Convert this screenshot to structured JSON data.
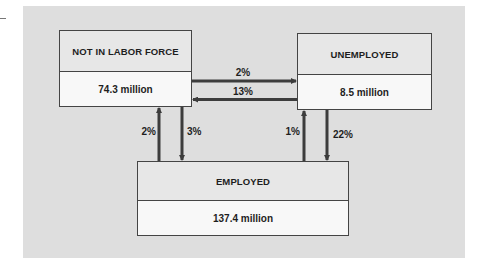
{
  "diagram": {
    "type": "labor-market-flows",
    "nodes": [
      {
        "id": "nlf",
        "title": "NOT IN LABOR FORCE",
        "value": "74.3 million"
      },
      {
        "id": "unemployed",
        "title": "UNEMPLOYED",
        "value": "8.5 million"
      },
      {
        "id": "employed",
        "title": "EMPLOYED",
        "value": "137.4 million"
      }
    ],
    "flows": {
      "nlf_to_unemployed": {
        "from": "NOT IN LABOR FORCE",
        "to": "UNEMPLOYED",
        "label": "2%"
      },
      "unemployed_to_nlf": {
        "from": "UNEMPLOYED",
        "to": "NOT IN LABOR FORCE",
        "label": "13%"
      },
      "employed_to_nlf": {
        "from": "EMPLOYED",
        "to": "NOT IN LABOR FORCE",
        "label": "2%"
      },
      "nlf_to_employed": {
        "from": "NOT IN LABOR FORCE",
        "to": "EMPLOYED",
        "label": "3%"
      },
      "employed_to_unemployed": {
        "from": "EMPLOYED",
        "to": "UNEMPLOYED",
        "label": "1%"
      },
      "unemployed_to_employed": {
        "from": "UNEMPLOYED",
        "to": "EMPLOYED",
        "label": "22%"
      }
    }
  },
  "colors": {
    "panel": "#dedede",
    "box_header": "#e7e7e7",
    "box_body": "#f8f8f8",
    "border": "#444444",
    "arrow": "#3c3c3c",
    "text": "#1e1e1e"
  }
}
